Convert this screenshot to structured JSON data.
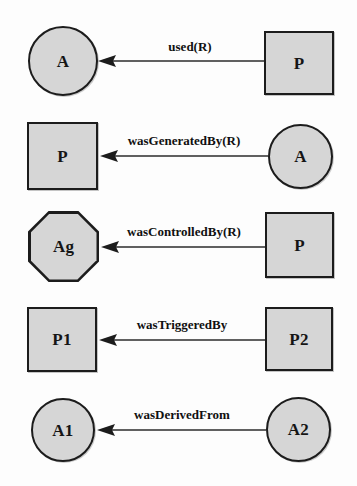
{
  "diagram": {
    "style": {
      "node_fill": "#d6d6d6",
      "node_stroke": "#1c1c1c",
      "edge_color": "#2b2b2b",
      "background": "#fdfdfd",
      "label_color": "#101010"
    },
    "relations": [
      {
        "id": "used",
        "edge_label": "used(R)",
        "source": {
          "label": "P",
          "shape": "rect"
        },
        "target": {
          "label": "A",
          "shape": "circle"
        }
      },
      {
        "id": "wasGeneratedBy",
        "edge_label": "wasGeneratedBy(R)",
        "source": {
          "label": "A",
          "shape": "circle"
        },
        "target": {
          "label": "P",
          "shape": "rect"
        }
      },
      {
        "id": "wasControlledBy",
        "edge_label": "wasControlledBy(R)",
        "source": {
          "label": "P",
          "shape": "rect"
        },
        "target": {
          "label": "Ag",
          "shape": "octagon"
        }
      },
      {
        "id": "wasTriggeredBy",
        "edge_label": "wasTriggeredBy",
        "source": {
          "label": "P2",
          "shape": "rect"
        },
        "target": {
          "label": "P1",
          "shape": "rect"
        }
      },
      {
        "id": "wasDerivedFrom",
        "edge_label": "wasDerivedFrom",
        "source": {
          "label": "A2",
          "shape": "circle"
        },
        "target": {
          "label": "A1",
          "shape": "circle"
        }
      }
    ]
  }
}
